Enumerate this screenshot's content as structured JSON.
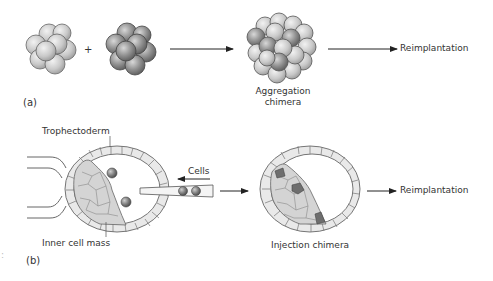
{
  "panel_a": {
    "tag": "(a)",
    "plus": "+",
    "product_label_line1": "Aggregation",
    "product_label_line2": "chimera",
    "outcome": "Reimplantation"
  },
  "panel_b": {
    "tag": "(b)",
    "trophectoderm_label": "Trophectoderm",
    "icm_label": "Inner cell mass",
    "cells_label": "Cells",
    "product_label": "Injection chimera",
    "outcome": "Reimplantation"
  },
  "colors": {
    "light_cell": "#c8c8c8",
    "dark_cell": "#8a8a8a",
    "outline": "#555555",
    "icm_fill": "#d6d6d6",
    "donor_cell": "#707070",
    "arrow": "#222222"
  },
  "stray_mark": ":"
}
